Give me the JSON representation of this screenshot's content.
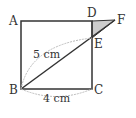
{
  "figure": {
    "points": {
      "A": {
        "label": "A",
        "x": 21,
        "y": 21
      },
      "D": {
        "label": "D",
        "x": 92,
        "y": 21
      },
      "F": {
        "label": "F",
        "x": 115,
        "y": 20
      },
      "E": {
        "label": "E",
        "x": 92,
        "y": 38
      },
      "B": {
        "label": "B",
        "x": 21,
        "y": 89
      },
      "C": {
        "label": "C",
        "x": 92,
        "y": 89
      }
    },
    "dimensions": {
      "BE": "5 cm",
      "BC": "4 cm"
    },
    "colors": {
      "stroke": "#333333",
      "shaded_triangle": "#cccccc",
      "dim_arc": "#bbbbbb"
    }
  }
}
